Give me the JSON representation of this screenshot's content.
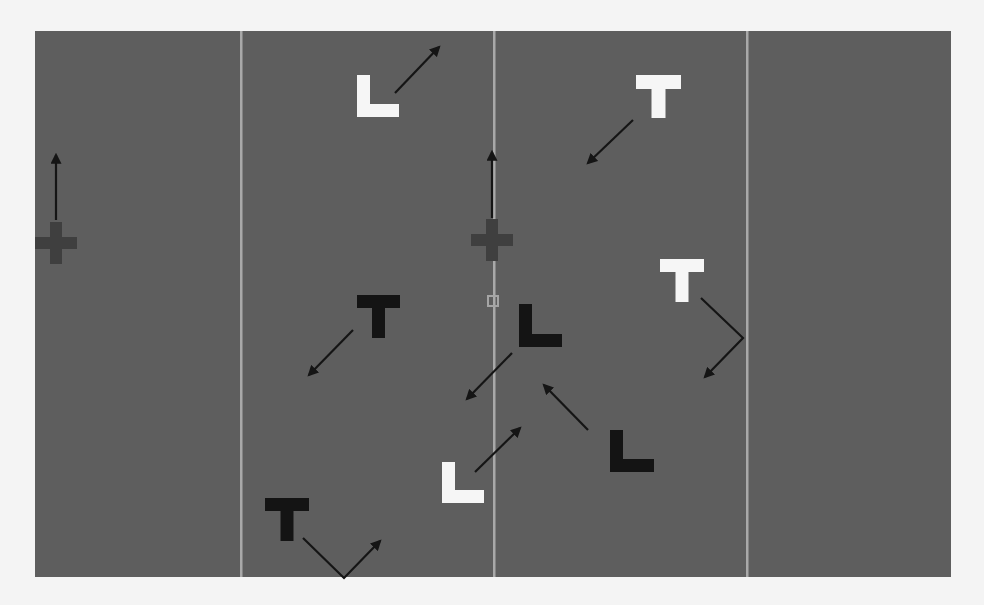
{
  "canvas": {
    "width": 984,
    "height": 605,
    "background": "#f4f4f4"
  },
  "panel": {
    "x": 35,
    "y": 31,
    "width": 916,
    "height": 546,
    "fill": "#5e5e5e"
  },
  "colors": {
    "white_letter": "#f6f6f6",
    "black_letter": "#141414",
    "divider": "#a9a9a9",
    "cross": "#3f3f3f",
    "arrow": "#151515",
    "fixation_square": "#a5a5a5"
  },
  "dividers": [
    {
      "x": 241
    },
    {
      "x": 494
    },
    {
      "x": 747
    }
  ],
  "fixation_square": {
    "x": 487,
    "y": 295,
    "size": 12
  },
  "crosses": [
    {
      "id": "cross-left",
      "cx": 56,
      "cy": 243,
      "size": 42,
      "arm": 12,
      "arrow": [
        [
          56,
          220
        ],
        [
          56,
          155
        ]
      ]
    },
    {
      "id": "cross-center",
      "cx": 492,
      "cy": 240,
      "size": 42,
      "arm": 12,
      "arrow": [
        [
          492,
          218
        ],
        [
          492,
          152
        ]
      ]
    }
  ],
  "letters": [
    {
      "id": "L-white-top",
      "glyph": "L",
      "color": "white",
      "x": 357,
      "y": 75,
      "w": 42,
      "h": 42,
      "arrow": [
        [
          395,
          93
        ],
        [
          439,
          47
        ]
      ]
    },
    {
      "id": "T-white-topright",
      "glyph": "T",
      "color": "white",
      "x": 636,
      "y": 75,
      "w": 45,
      "h": 43,
      "arrow": [
        [
          633,
          120
        ],
        [
          588,
          163
        ]
      ]
    },
    {
      "id": "T-white-right",
      "glyph": "T",
      "color": "white",
      "x": 660,
      "y": 259,
      "w": 44,
      "h": 43,
      "arrow": [
        [
          701,
          298
        ],
        [
          743,
          338
        ],
        [
          705,
          377
        ]
      ]
    },
    {
      "id": "T-black-left",
      "glyph": "T",
      "color": "black",
      "x": 357,
      "y": 295,
      "w": 43,
      "h": 43,
      "arrow": [
        [
          353,
          330
        ],
        [
          309,
          375
        ]
      ]
    },
    {
      "id": "L-black-center",
      "glyph": "L",
      "color": "black",
      "x": 519,
      "y": 304,
      "w": 43,
      "h": 43,
      "arrow": [
        [
          512,
          353
        ],
        [
          467,
          399
        ]
      ]
    },
    {
      "id": "L-black-lowright",
      "glyph": "L",
      "color": "black",
      "x": 610,
      "y": 430,
      "w": 44,
      "h": 42,
      "arrow": [
        [
          588,
          430
        ],
        [
          544,
          385
        ]
      ]
    },
    {
      "id": "L-white-bottom",
      "glyph": "L",
      "color": "white",
      "x": 442,
      "y": 462,
      "w": 42,
      "h": 41,
      "arrow": [
        [
          475,
          472
        ],
        [
          520,
          428
        ]
      ]
    },
    {
      "id": "T-black-bottomleft",
      "glyph": "T",
      "color": "black",
      "x": 265,
      "y": 498,
      "w": 44,
      "h": 43,
      "arrow": [
        [
          303,
          538
        ],
        [
          344,
          578
        ],
        [
          380,
          541
        ]
      ]
    }
  ]
}
